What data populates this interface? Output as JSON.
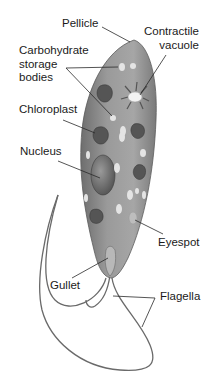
{
  "diagram": {
    "labels": {
      "pellicle": "Pellicle",
      "contractile_vacuole_line1": "Contractile",
      "contractile_vacuole_line2": "vacuole",
      "carbohydrate_line1": "Carbohydrate",
      "carbohydrate_line2": "storage",
      "carbohydrate_line3": "bodies",
      "chloroplast": "Chloroplast",
      "nucleus": "Nucleus",
      "eyespot": "Eyespot",
      "gullet": "Gullet",
      "flagella": "Flagella"
    },
    "colors": {
      "body": "#8e8e8e",
      "body_light": "#b5b5b5",
      "body_dark": "#6a6a6a",
      "organelle_dark": "#4a4a4a",
      "granule": "#e6e6e6",
      "leader_line": "#2a2a2a",
      "text": "#1a1a1a"
    }
  }
}
